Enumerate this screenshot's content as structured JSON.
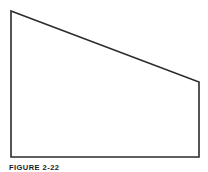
{
  "figure": {
    "caption": "FIGURE 2-22",
    "background_color": "#ffffff",
    "stroke_color": "#2b2b2b",
    "fill_color": "#ffffff",
    "stroke_width": 1.6,
    "shape_name": "right-trapezoid",
    "shape_points": "11,11 199,82 199,157 11,157",
    "vertices": [
      {
        "label": "top-left-apex",
        "x": 11,
        "y": 11
      },
      {
        "label": "right-upper",
        "x": 199,
        "y": 82
      },
      {
        "label": "bottom-right",
        "x": 199,
        "y": 157
      },
      {
        "label": "bottom-left",
        "x": 11,
        "y": 157
      }
    ],
    "edges": [
      {
        "name": "hypotenuse-edge",
        "from": "top-left-apex",
        "to": "right-upper"
      },
      {
        "name": "right-vertical-edge",
        "from": "right-upper",
        "to": "bottom-right"
      },
      {
        "name": "bottom-horizontal-edge",
        "from": "bottom-right",
        "to": "bottom-left"
      },
      {
        "name": "left-vertical-edge",
        "from": "bottom-left",
        "to": "top-left-apex"
      }
    ]
  }
}
